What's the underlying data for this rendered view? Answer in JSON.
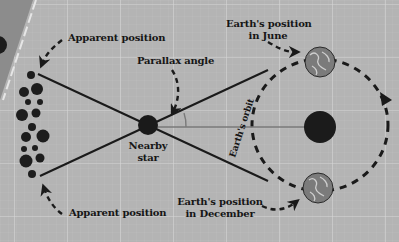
{
  "diagram": {
    "colors": {
      "background": "#b4b4b4",
      "grid_major": "#d4d4d4",
      "grid_minor": "#c2c2c2",
      "dark_band": "#8a8a8a",
      "ink": "#1a1a1a",
      "earth": "#7a7a7a",
      "earth_land": "#c8c8c8",
      "sun_line": "#7a7a7a"
    },
    "labels": {
      "apparent_position_top": "Apparent position",
      "apparent_position_bottom": "Apparent position",
      "parallax_angle": "Parallax angle",
      "nearby_star_line1": "Nearby",
      "nearby_star_line2": "star",
      "earth_june_line1": "Earth's position",
      "earth_june_line2": "in June",
      "earth_december_line1": "Earth's position",
      "earth_december_line2": "in December",
      "earths_orbit": "Earth's orbit"
    },
    "nodes": [
      {
        "id": "nearby-star",
        "label": "Nearby star",
        "x": 148,
        "y": 125,
        "r": 10
      },
      {
        "id": "sun",
        "label": "",
        "x": 320,
        "y": 127,
        "r": 16
      },
      {
        "id": "earth-june",
        "label": "Earth's position in June",
        "x": 320,
        "y": 62,
        "r": 15
      },
      {
        "id": "earth-december",
        "label": "Earth's position in December",
        "x": 318,
        "y": 188,
        "r": 15
      }
    ],
    "edges": [
      {
        "from": "apparent-position-top",
        "to": "earth-december",
        "via": "nearby-star",
        "style": "solid"
      },
      {
        "from": "apparent-position-bottom",
        "to": "earth-june",
        "via": "nearby-star",
        "style": "solid"
      },
      {
        "from": "nearby-star",
        "to": "sun",
        "style": "solid-gray"
      }
    ]
  }
}
